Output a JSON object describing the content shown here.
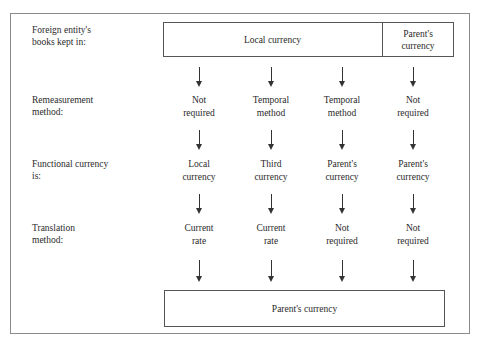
{
  "rows": {
    "books": {
      "label_1": "Foreign entity's",
      "label_2": "books kept in:"
    },
    "remeasurement": {
      "label_1": "Remeasurement",
      "label_2": "method:"
    },
    "functional": {
      "label_1": "Functional currency",
      "label_2": "is:"
    },
    "translation": {
      "label_1": "Translation",
      "label_2": "method:"
    }
  },
  "top_box": {
    "local": "Local currency",
    "parent_1": "Parent's",
    "parent_2": "currency"
  },
  "columns": [
    {
      "remeasurement": [
        "Not",
        "required"
      ],
      "functional": [
        "Local",
        "currency"
      ],
      "translation": [
        "Current",
        "rate"
      ]
    },
    {
      "remeasurement": [
        "Temporal",
        "method"
      ],
      "functional": [
        "Third",
        "currency"
      ],
      "translation": [
        "Current",
        "rate"
      ]
    },
    {
      "remeasurement": [
        "Temporal",
        "method"
      ],
      "functional": [
        "Parent's",
        "currency"
      ],
      "translation": [
        "Not",
        "required"
      ]
    },
    {
      "remeasurement": [
        "Not",
        "required"
      ],
      "functional": [
        "Parent's",
        "currency"
      ],
      "translation": [
        "Not",
        "required"
      ]
    }
  ],
  "bottom_box": {
    "label": "Parent's currency"
  },
  "colors": {
    "frame": "#8a8a8a",
    "box_border": "#555555",
    "text": "#2a2a2a",
    "arrow": "#333333"
  }
}
